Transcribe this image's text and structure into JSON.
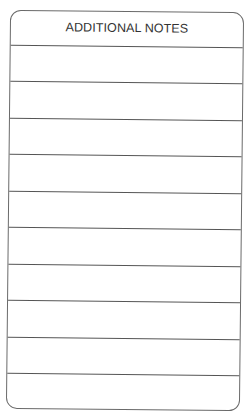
{
  "card": {
    "title": "ADDITIONAL NOTES",
    "ruled_lines": 10,
    "border_color": "#6a6a6a"
  }
}
